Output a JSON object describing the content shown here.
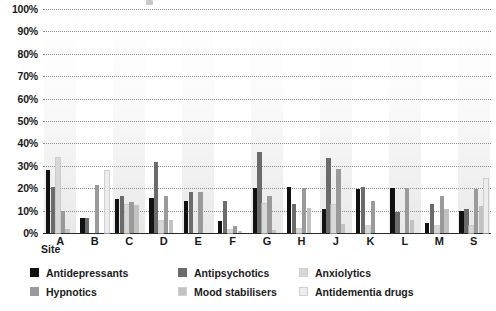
{
  "chart_data": {
    "type": "bar",
    "title": "",
    "xlabel": "Site",
    "ylabel": "",
    "ylim": [
      0,
      100
    ],
    "yticks": [
      0,
      10,
      20,
      30,
      40,
      50,
      60,
      70,
      80,
      90,
      100
    ],
    "ytick_labels": [
      "0%",
      "10%",
      "20%",
      "30%",
      "40%",
      "50%",
      "60%",
      "70%",
      "80%",
      "90%",
      "100%"
    ],
    "grid": true,
    "legend_position": "bottom",
    "categories": [
      "A",
      "B",
      "C",
      "D",
      "E",
      "F",
      "G",
      "H",
      "J",
      "K",
      "L",
      "M",
      "S"
    ],
    "series": [
      {
        "name": "Antidepressants",
        "color": "#111111",
        "values": [
          28,
          6.5,
          15,
          15.5,
          14.5,
          5.5,
          20,
          20.5,
          10.5,
          19.5,
          20,
          4.5,
          10
        ]
      },
      {
        "name": "Antipsychotics",
        "color": "#6b6b6b",
        "values": [
          20.5,
          6.5,
          16.5,
          31.5,
          18.5,
          14.5,
          36,
          13,
          33.5,
          20.5,
          9.5,
          13,
          10.5
        ]
      },
      {
        "name": "Anxiolytics",
        "color": "#d8d8d8",
        "values": [
          33.5,
          0,
          12.5,
          5.5,
          0,
          1.5,
          13,
          2,
          12.5,
          3,
          0,
          3,
          3
        ]
      },
      {
        "name": "Hypnotics",
        "color": "#9a9a9a",
        "values": [
          10,
          21.5,
          14,
          16.5,
          18.5,
          3,
          16.5,
          20,
          28.5,
          14.5,
          20,
          16.5,
          19.5
        ]
      },
      {
        "name": "Mood stabilisers",
        "color": "#c2c2c2",
        "values": [
          2,
          0,
          12.5,
          6,
          0,
          1,
          1.5,
          11,
          4,
          0,
          6,
          10.5,
          12
        ]
      },
      {
        "name": "Antidementia drugs",
        "color": "#ededed",
        "values": [
          0,
          27.5,
          0,
          0,
          0,
          0,
          0,
          0,
          0,
          0,
          0,
          0,
          24
        ]
      }
    ]
  },
  "legend": {
    "items": [
      {
        "label": "Antidepressants",
        "color": "#111111"
      },
      {
        "label": "Antipsychotics",
        "color": "#6b6b6b"
      },
      {
        "label": "Anxiolytics",
        "color": "#d8d8d8"
      },
      {
        "label": "Hypnotics",
        "color": "#9a9a9a"
      },
      {
        "label": "Mood stabilisers",
        "color": "#c2c2c2"
      },
      {
        "label": "Antidementia drugs",
        "color": "#ededed"
      }
    ]
  }
}
